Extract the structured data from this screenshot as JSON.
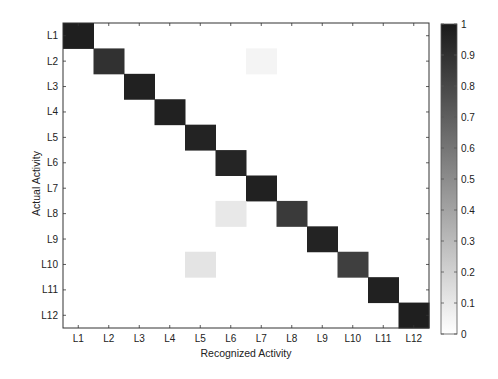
{
  "chart_data": {
    "type": "heatmap",
    "title": "",
    "xlabel": "Recognized Activity",
    "ylabel": "Actual Activity",
    "x_categories": [
      "L1",
      "L2",
      "L3",
      "L4",
      "L5",
      "L6",
      "L7",
      "L8",
      "L9",
      "L10",
      "L11",
      "L12"
    ],
    "y_categories": [
      "L1",
      "L2",
      "L3",
      "L4",
      "L5",
      "L6",
      "L7",
      "L8",
      "L9",
      "L10",
      "L11",
      "L12"
    ],
    "values_note": "Cell values were estimated by eye from grayscale shade; no numbers are printed in the figure. Off-diagonal entries are rough approximations.",
    "values": [
      [
        0.98,
        0,
        0,
        0,
        0,
        0,
        0,
        0,
        0,
        0,
        0,
        0
      ],
      [
        0,
        0.9,
        0,
        0,
        0,
        0,
        0.05,
        0,
        0,
        0,
        0,
        0
      ],
      [
        0,
        0,
        0.97,
        0,
        0,
        0,
        0,
        0,
        0,
        0,
        0,
        0
      ],
      [
        0,
        0,
        0,
        0.97,
        0,
        0,
        0,
        0,
        0,
        0,
        0,
        0
      ],
      [
        0,
        0,
        0,
        0,
        0.96,
        0,
        0,
        0,
        0,
        0,
        0,
        0
      ],
      [
        0,
        0,
        0,
        0,
        0,
        0.95,
        0,
        0,
        0,
        0,
        0,
        0
      ],
      [
        0,
        0,
        0,
        0,
        0,
        0,
        0.97,
        0,
        0,
        0,
        0,
        0
      ],
      [
        0,
        0,
        0,
        0,
        0,
        0.1,
        0,
        0.86,
        0,
        0,
        0,
        0
      ],
      [
        0,
        0,
        0,
        0,
        0,
        0,
        0,
        0,
        0.96,
        0,
        0,
        0
      ],
      [
        0,
        0,
        0,
        0,
        0.12,
        0,
        0,
        0,
        0,
        0.84,
        0,
        0
      ],
      [
        0,
        0,
        0,
        0,
        0,
        0,
        0,
        0,
        0,
        0,
        0.97,
        0
      ],
      [
        0,
        0,
        0,
        0,
        0,
        0,
        0,
        0,
        0,
        0,
        0,
        0.98
      ]
    ],
    "colormap": "gray_reversed",
    "colorbar": {
      "min": 0,
      "max": 1,
      "ticks": [
        0,
        0.1,
        0.2,
        0.3,
        0.4,
        0.5,
        0.6,
        0.7,
        0.8,
        0.9,
        1
      ],
      "tick_labels": [
        "0",
        "0.1",
        "0.2",
        "0.3",
        "0.4",
        "0.5",
        "0.6",
        "0.7",
        "0.8",
        "0.9",
        "1"
      ],
      "position": "right"
    },
    "grid": false
  },
  "colors": {
    "low": "#ffffff",
    "high": "#1a1a1a",
    "axis": "#333333"
  }
}
